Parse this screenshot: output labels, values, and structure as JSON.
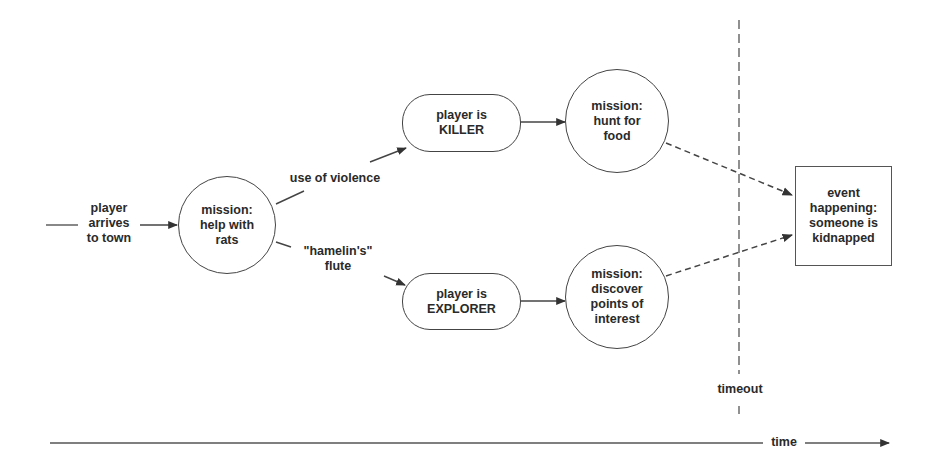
{
  "diagram": {
    "type": "flow / state diagram over time",
    "start_label": "player\narrives\nto town",
    "nodes": [
      {
        "id": "mission_rats",
        "shape": "circle",
        "label": "mission:\nhelp with\nrats"
      },
      {
        "id": "player_killer",
        "shape": "pill",
        "label": "player is\nKILLER"
      },
      {
        "id": "player_explorer",
        "shape": "pill",
        "label": "player is\nEXPLORER"
      },
      {
        "id": "mission_hunt",
        "shape": "circle",
        "label": "mission:\nhunt for\nfood"
      },
      {
        "id": "mission_discover",
        "shape": "circle",
        "label": "mission:\ndiscover\npoints of\ninterest"
      },
      {
        "id": "event_kidnapped",
        "shape": "rectangle",
        "label": "event\nhappening:\nsomeone is\nkidnapped"
      }
    ],
    "edges": [
      {
        "from": "start",
        "to": "mission_rats",
        "style": "solid",
        "label": ""
      },
      {
        "from": "mission_rats",
        "to": "player_killer",
        "style": "solid",
        "label": "use of violence"
      },
      {
        "from": "mission_rats",
        "to": "player_explorer",
        "style": "solid",
        "label": "\"hamelin's\"\nflute"
      },
      {
        "from": "player_killer",
        "to": "mission_hunt",
        "style": "solid",
        "label": ""
      },
      {
        "from": "player_explorer",
        "to": "mission_discover",
        "style": "solid",
        "label": ""
      },
      {
        "from": "mission_hunt",
        "to": "event_kidnapped",
        "style": "dashed",
        "label": ""
      },
      {
        "from": "mission_discover",
        "to": "event_kidnapped",
        "style": "dashed",
        "label": ""
      }
    ],
    "edge_labels": {
      "violence": "use of violence",
      "flute": "\"hamelin's\"\nflute"
    },
    "timeout_label": "timeout",
    "time_axis_label": "time"
  },
  "colors": {
    "stroke": "#444444",
    "text": "#2a2a2a",
    "background": "#ffffff"
  }
}
